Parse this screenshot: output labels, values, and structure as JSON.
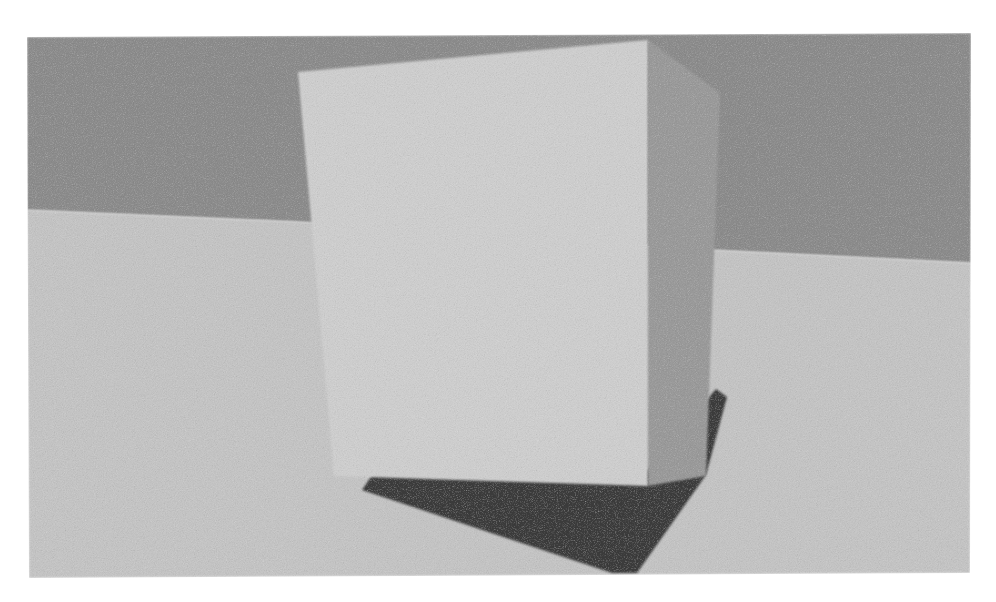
{
  "scene": {
    "title": "rendered-3d-box-scene",
    "canvas": {
      "width": 996,
      "height": 602,
      "background_color": "#ffffff"
    },
    "render_style": "grayscale noisy raytraced render",
    "noise": {
      "enabled": true,
      "type": "monochrome-grain",
      "amount": 0.42,
      "base_frequency": 0.9
    },
    "image_frame": {
      "name": "render-viewport",
      "description": "slightly rotated rectangular render inset within white page margin",
      "corners": [
        {
          "x": 27,
          "y": 37
        },
        {
          "x": 971,
          "y": 33
        },
        {
          "x": 970,
          "y": 573
        },
        {
          "x": 29,
          "y": 578
        }
      ]
    },
    "elements": [
      {
        "name": "back-wall",
        "label": "Back wall plane",
        "color": "#8b8b8b",
        "points": "27,37 971,33 971,263 712,250 300,222 27,210"
      },
      {
        "name": "floor-plane",
        "label": "Ground floor plane",
        "color": "#c3c3c3",
        "points": "27,210 300,222 712,250 971,263 970,573 29,578"
      },
      {
        "name": "cast-shadow",
        "label": "Cast shadow on floor",
        "color": "#3b3b3b",
        "points": "396,440 645,473 716,389 727,397 706,475 637,573 612,573 362,490"
      },
      {
        "name": "box-front-face",
        "label": "Box front / left visible face",
        "color": "#cdcdcd",
        "points": "298,72 648,40 648,486 334,476"
      },
      {
        "name": "box-right-face",
        "label": "Box right side face in shade",
        "color": "#999999",
        "points": "648,40 720,93 706,476 648,486"
      }
    ],
    "palette": {
      "page_background": "#ffffff",
      "wall": "#8b8b8b",
      "floor": "#c3c3c3",
      "box_front": "#cdcdcd",
      "box_side": "#999999",
      "shadow": "#3b3b3b"
    },
    "lighting": {
      "description": "single key light from upper-left, casting a long shadow to the lower-left",
      "shadow_direction": "lower-left"
    }
  }
}
